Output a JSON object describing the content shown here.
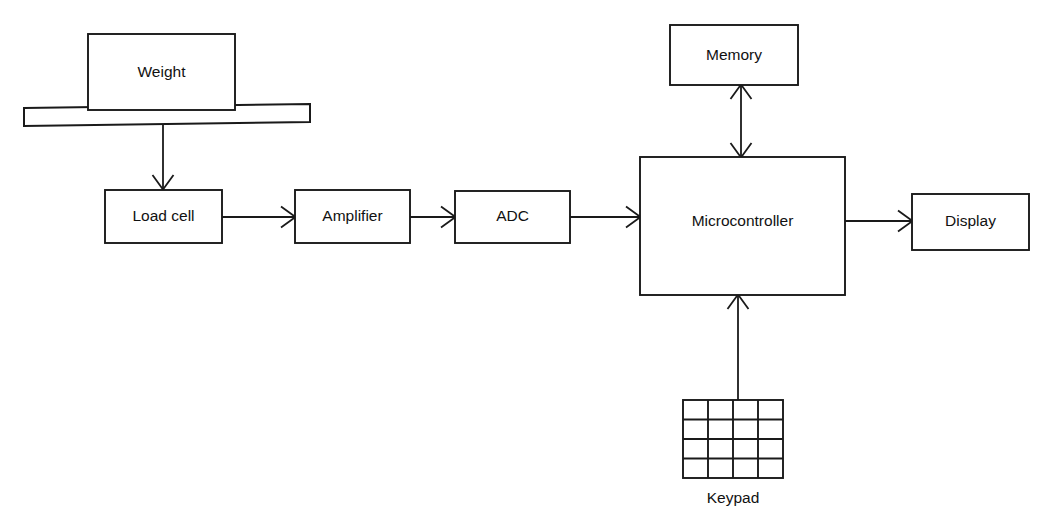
{
  "diagram": {
    "background_color": "#ffffff",
    "line_color": "#1a1a1a",
    "blocks": [
      {
        "id": "weight",
        "label": "Weight",
        "x": 88,
        "y": 34,
        "w": 147,
        "h": 76
      },
      {
        "id": "load-cell",
        "label": "Load cell",
        "x": 105,
        "y": 190,
        "w": 117,
        "h": 53
      },
      {
        "id": "amplifier",
        "label": "Amplifier",
        "x": 295,
        "y": 190,
        "w": 115,
        "h": 53
      },
      {
        "id": "adc",
        "label": "ADC",
        "x": 455,
        "y": 191,
        "w": 115,
        "h": 52
      },
      {
        "id": "microcontroller",
        "label": "Microcontroller",
        "x": 640,
        "y": 157,
        "w": 205,
        "h": 138
      },
      {
        "id": "memory",
        "label": "Memory",
        "x": 670,
        "y": 25,
        "w": 128,
        "h": 60
      },
      {
        "id": "display",
        "label": "Display",
        "x": 912,
        "y": 194,
        "w": 117,
        "h": 56
      }
    ],
    "platform": {
      "id": "scale-platform",
      "label": ""
    },
    "keypad": {
      "id": "keypad",
      "label": "Keypad",
      "x": 683,
      "y": 400,
      "w": 100,
      "h": 78,
      "rows": 4,
      "cols": 4
    },
    "connections": [
      {
        "id": "platform-to-load-cell",
        "from": "scale-platform",
        "to": "load-cell",
        "direction": "one-way",
        "orientation": "vertical"
      },
      {
        "id": "load-cell-to-amplifier",
        "from": "load-cell",
        "to": "amplifier",
        "direction": "one-way",
        "orientation": "horizontal"
      },
      {
        "id": "amplifier-to-adc",
        "from": "amplifier",
        "to": "adc",
        "direction": "one-way",
        "orientation": "horizontal"
      },
      {
        "id": "adc-to-microcontroller",
        "from": "adc",
        "to": "microcontroller",
        "direction": "one-way",
        "orientation": "horizontal"
      },
      {
        "id": "microcontroller-to-memory",
        "from": "microcontroller",
        "to": "memory",
        "direction": "two-way",
        "orientation": "vertical"
      },
      {
        "id": "microcontroller-to-display",
        "from": "microcontroller",
        "to": "display",
        "direction": "one-way",
        "orientation": "horizontal"
      },
      {
        "id": "keypad-to-microcontroller",
        "from": "keypad",
        "to": "microcontroller",
        "direction": "one-way",
        "orientation": "vertical"
      }
    ]
  }
}
